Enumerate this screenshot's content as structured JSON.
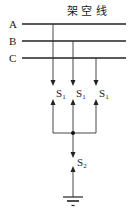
{
  "diagram": {
    "title": "架 空 线",
    "phases": [
      {
        "label": "A",
        "y": 24
      },
      {
        "label": "B",
        "y": 41
      },
      {
        "label": "C",
        "y": 58
      }
    ],
    "switches_upper": [
      {
        "label": "S",
        "sub": "1",
        "x": 53
      },
      {
        "label": "S",
        "sub": "1",
        "x": 73
      },
      {
        "label": "S",
        "sub": "1",
        "x": 96
      }
    ],
    "switch_lower": {
      "label": "S",
      "sub": "2",
      "x": 73
    },
    "ground": {
      "symbol": "ground"
    },
    "colors": {
      "line": "#222222",
      "background": "#ffffff"
    }
  }
}
